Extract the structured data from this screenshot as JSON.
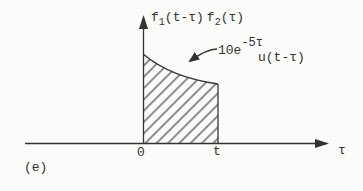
{
  "figure": {
    "caption": "(e)",
    "colors": {
      "ink": "#333333",
      "background": "#fbfbf9"
    },
    "y_axis_label": {
      "f1": "f",
      "sub1": "1",
      "arg1": "(t-τ)",
      "f2": "f",
      "sub2": "2",
      "arg2": "(τ)"
    },
    "x_axis_label": "τ",
    "ticks": {
      "origin": "0",
      "t": "t"
    },
    "annotation": {
      "coefficient": "10e",
      "exponent": "-5τ",
      "step_function": "u(t-τ)"
    }
  }
}
